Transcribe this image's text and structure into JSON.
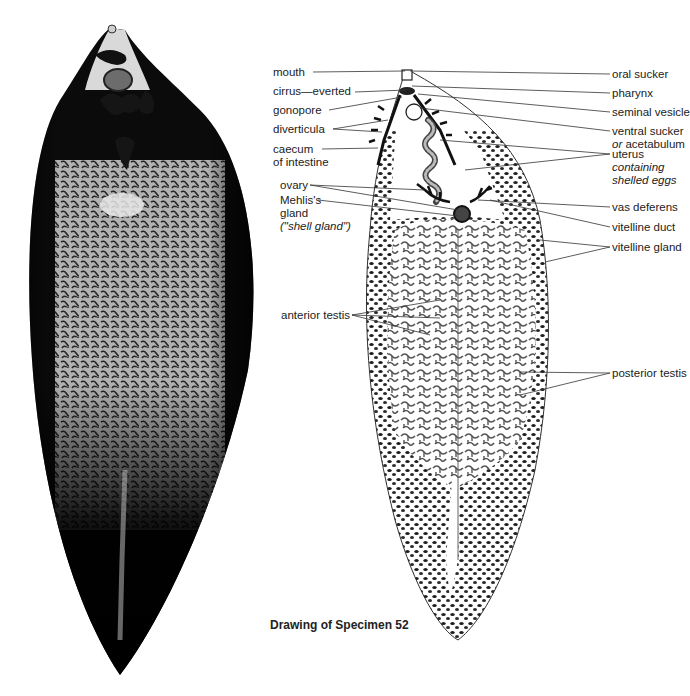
{
  "figure": {
    "caption": "Drawing of Specimen 52",
    "photo_alt": "Photograph of stained liver fluke specimen",
    "drawing_alt": "Labelled line drawing of liver fluke"
  },
  "labels_left": {
    "mouth": "mouth",
    "cirrus": "cirrus—everted",
    "gonopore": "gonopore",
    "diverticula": "diverticula",
    "caecum_1": "caecum",
    "caecum_2": "of intestine",
    "ovary": "ovary",
    "mehlis_1": "Mehlis's",
    "mehlis_2": "gland",
    "mehlis_3": "(\"shell gland\")",
    "anterior_testis": "anterior testis"
  },
  "labels_right": {
    "oral_sucker": "oral sucker",
    "pharynx": "pharynx",
    "seminal_vesicle": "seminal vesicle",
    "ventral_sucker_1": "ventral sucker",
    "ventral_sucker_2_prefix": "or",
    "ventral_sucker_2": " acetabulum",
    "uterus_1": "uterus",
    "uterus_2": "containing",
    "uterus_3": "shelled eggs",
    "vas_deferens": "vas deferens",
    "vitelline_duct": "vitelline duct",
    "vitelline_gland": "vitelline gland",
    "posterior_testis": "posterior testis"
  }
}
